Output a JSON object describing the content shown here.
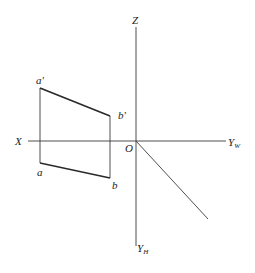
{
  "diagram": {
    "type": "orthographic-projection",
    "axes": {
      "z_label": "Z",
      "x_label": "X",
      "origin_label": "O",
      "yw_label": "Y",
      "yw_sub": "W",
      "yh_label": "Y",
      "yh_sub": "H"
    },
    "points": {
      "a_prime": "a'",
      "b_prime": "b'",
      "a": "a",
      "b": "b"
    }
  }
}
